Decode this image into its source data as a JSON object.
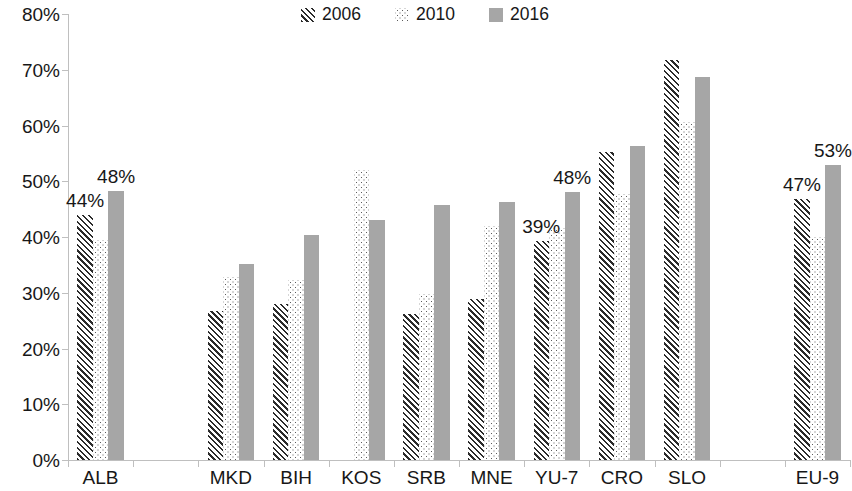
{
  "legend": {
    "items": [
      {
        "label": "2006",
        "pattern": "diagonal-hatch"
      },
      {
        "label": "2010",
        "pattern": "dotted"
      },
      {
        "label": "2016",
        "pattern": "solid-gray"
      }
    ]
  },
  "axes": {
    "y_ticks": [
      "0%",
      "10%",
      "20%",
      "30%",
      "40%",
      "50%",
      "60%",
      "70%",
      "80%"
    ],
    "x_ticks": [
      "ALB",
      "",
      "MKD",
      "BIH",
      "KOS",
      "SRB",
      "MNE",
      "YU-7",
      "CRO",
      "SLO",
      "",
      "EU-9"
    ]
  },
  "colors": {
    "series_2006": "#2b2b2b",
    "series_2010": "#5c5c5c",
    "series_2016": "#a6a6a6",
    "axis": "#bfbfbf",
    "text": "#171717",
    "background": "#ffffff"
  },
  "chart_data": {
    "type": "bar",
    "title": "",
    "subtitle": "",
    "xlabel": "",
    "ylabel": "",
    "ylim": [
      0,
      80
    ],
    "ytick_step": 10,
    "grid": false,
    "legend_position": "top-center",
    "categories": [
      "ALB",
      "",
      "MKD",
      "BIH",
      "KOS",
      "SRB",
      "MNE",
      "YU-7",
      "CRO",
      "SLO",
      "",
      "EU-9"
    ],
    "series": [
      {
        "name": "2006",
        "values": [
          44.0,
          null,
          26.7,
          28.0,
          null,
          26.2,
          28.8,
          39.3,
          55.2,
          71.8,
          null,
          46.9
        ]
      },
      {
        "name": "2010",
        "values": [
          39.5,
          null,
          32.8,
          32.3,
          52.1,
          29.8,
          42.0,
          41.6,
          47.8,
          60.6,
          null,
          40.0
        ]
      },
      {
        "name": "2016",
        "values": [
          48.2,
          null,
          35.2,
          40.3,
          43.0,
          45.7,
          46.3,
          48.0,
          56.4,
          68.7,
          null,
          53.0
        ]
      }
    ],
    "data_labels": [
      {
        "category": "ALB",
        "series": "2006",
        "text": "44%"
      },
      {
        "category": "ALB",
        "series": "2016",
        "text": "48%"
      },
      {
        "category": "YU-7",
        "series": "2006",
        "text": "39%"
      },
      {
        "category": "YU-7",
        "series": "2016",
        "text": "48%"
      },
      {
        "category": "EU-9",
        "series": "2006",
        "text": "47%"
      },
      {
        "category": "EU-9",
        "series": "2016",
        "text": "53%"
      }
    ]
  }
}
